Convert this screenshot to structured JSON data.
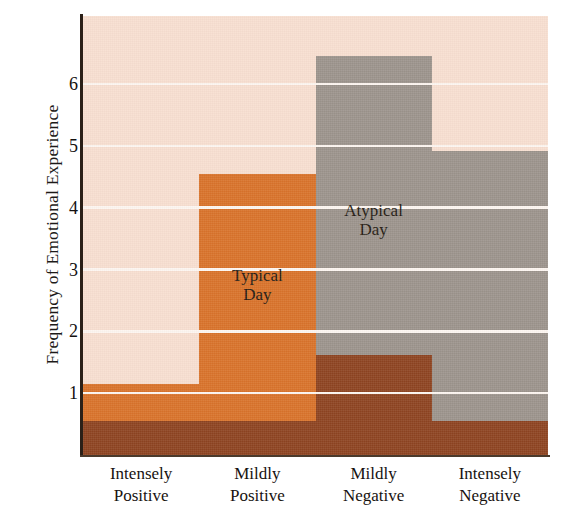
{
  "chart_data": {
    "type": "bar",
    "title": "",
    "subtitle": "",
    "xlabel": "",
    "ylabel": "Frequency of Emotional Experience",
    "categories": [
      "Intensely Positive",
      "Mildly Positive",
      "Mildly Negative",
      "Intensely Negative"
    ],
    "category_lines": [
      [
        "Intensely",
        "Positive"
      ],
      [
        "Mildly",
        "Positive"
      ],
      [
        "Mildly",
        "Negative"
      ],
      [
        "Intensely",
        "Negative"
      ]
    ],
    "ylim": [
      0,
      7.1
    ],
    "yticks": [
      1,
      2,
      3,
      4,
      5,
      6
    ],
    "ytick_labels": [
      "1",
      "2",
      "3",
      "4",
      "5",
      "6"
    ],
    "grid": "horizontal",
    "legend_position": "inline-annotation",
    "series": [
      {
        "name": "Typical Day",
        "color": "#d9722a",
        "values": [
          1.15,
          4.55,
          0.55,
          0.55
        ]
      },
      {
        "name": "Atypical Day",
        "color": "#9c948c",
        "values": [
          0.55,
          0.55,
          6.45,
          4.92
        ]
      },
      {
        "name": "Overlap",
        "color": "#8e4420",
        "values": [
          0.55,
          0.55,
          1.62,
          0.55
        ]
      }
    ],
    "annotations": [
      {
        "text": "Typical Day",
        "lines": [
          "Typical",
          "Day"
        ],
        "category": "Mildly Positive"
      },
      {
        "text": "Atypical Day",
        "lines": [
          "Atypical",
          "Day"
        ],
        "category": "Mildly Negative"
      }
    ],
    "colors": {
      "background": "#f8dfd0",
      "gridline": "#fdf6f0",
      "axis": "#2b2018",
      "typical_day": "#d9722a",
      "atypical_day": "#9c948c",
      "overlap": "#8e4420",
      "text": "#17120f"
    }
  }
}
